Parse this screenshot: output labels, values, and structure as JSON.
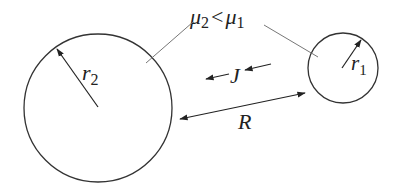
{
  "diagram": {
    "colors": {
      "stroke": "#333333",
      "leader": "#777777",
      "text": "#222222",
      "background": "#ffffff"
    },
    "large_circle": {
      "label_symbol": "r",
      "label_subscript": "2",
      "cx": 98,
      "cy": 108,
      "radius": 74
    },
    "small_circle": {
      "label_symbol": "r",
      "label_subscript": "1",
      "cx": 343,
      "cy": 68,
      "radius": 35
    },
    "mobility_relation": {
      "left_symbol": "μ",
      "left_subscript": "2",
      "operator": "<",
      "right_symbol": "μ",
      "right_subscript": "1"
    },
    "flux_label": "J",
    "distance_label": "R"
  }
}
